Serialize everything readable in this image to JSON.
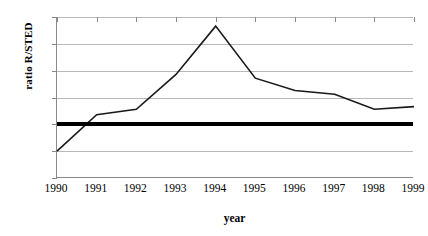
{
  "chart_data": {
    "type": "line",
    "title": "",
    "xlabel": "year",
    "ylabel": "ratio R/STED",
    "categories": [
      "1990",
      "1991",
      "1992",
      "1993",
      "1994",
      "1995",
      "1996",
      "1997",
      "1998",
      "1999"
    ],
    "x": [
      1990,
      1991,
      1992,
      1993,
      1994,
      1995,
      1996,
      1997,
      1998,
      1999
    ],
    "values": [
      50,
      118,
      128,
      193,
      283,
      186,
      163,
      156,
      128,
      133
    ],
    "series": [
      {
        "name": "ratio R/STED",
        "values": [
          50,
          118,
          128,
          193,
          283,
          186,
          163,
          156,
          128,
          133
        ],
        "color": "#1a1a1a"
      }
    ],
    "reference_line": {
      "name": "baseline-100",
      "value": 100,
      "color": "#000000",
      "width_px": 4
    },
    "ylim": [
      0,
      300
    ],
    "yticks": [
      0,
      50,
      100,
      150,
      200,
      250,
      300
    ],
    "ytick_labels": [
      "0",
      "50",
      "100",
      "150",
      "200",
      "250",
      "300"
    ],
    "xlim": [
      1990,
      1999
    ],
    "grid": "horizontal",
    "legend": "none",
    "gridline_color": "#b9b9b9",
    "axis_color": "#8a8a8a",
    "background": "#ffffff"
  }
}
